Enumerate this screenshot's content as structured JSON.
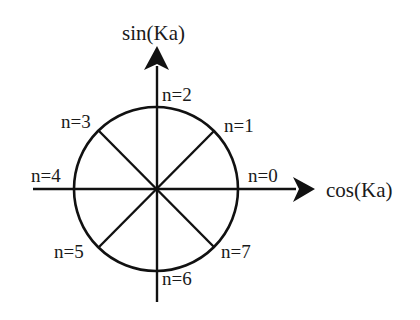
{
  "diagram": {
    "axes": {
      "x_label": "cos(Ka)",
      "y_label": "sin(Ka)"
    },
    "points": [
      {
        "label": "n=0",
        "angle_deg": 0
      },
      {
        "label": "n=1",
        "angle_deg": 45
      },
      {
        "label": "n=2",
        "angle_deg": 90
      },
      {
        "label": "n=3",
        "angle_deg": 135
      },
      {
        "label": "n=4",
        "angle_deg": 180
      },
      {
        "label": "n=5",
        "angle_deg": 225
      },
      {
        "label": "n=6",
        "angle_deg": 270
      },
      {
        "label": "n=7",
        "angle_deg": 315
      }
    ],
    "colors": {
      "stroke": "#111111",
      "background": "#ffffff"
    }
  }
}
